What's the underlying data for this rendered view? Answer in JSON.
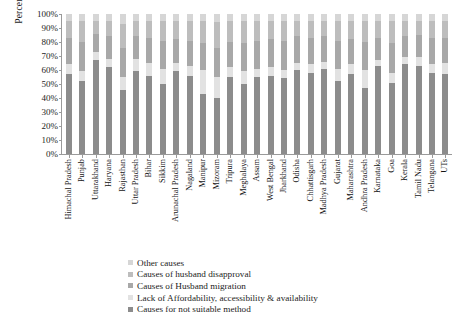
{
  "chart_data": {
    "type": "bar",
    "stacked": true,
    "stack_mode": "percent",
    "title": "",
    "xlabel": "",
    "ylabel": "Percentage",
    "ylim": [
      0,
      100
    ],
    "ytick_labels": [
      "0%",
      "10%",
      "20%",
      "30%",
      "40%",
      "50%",
      "60%",
      "70%",
      "80%",
      "90%",
      "100%"
    ],
    "ytick_values": [
      0,
      10,
      20,
      30,
      40,
      50,
      60,
      70,
      80,
      90,
      100
    ],
    "grid": false,
    "legend_position": "bottom",
    "categories": [
      "Himachal Pradesh",
      "Punjab",
      "Uttarakhand",
      "Haryana",
      "Rajasthan",
      "Uttar Pradesh",
      "Bihar",
      "Sikkim",
      "Arunachal Pradesh",
      "Nagaland",
      "Manipur",
      "Mizoram",
      "Tripura",
      "Meghalaya",
      "Assam",
      "West Bengal",
      "Jharkhand",
      "Odisha",
      "Chhattisgarh",
      "Madhya Pradesh",
      "Gujarat",
      "Maharashtra",
      "Andhra Pradesh",
      "Karnataka",
      "Goa",
      "Kerala",
      "Tamil Nadu",
      "Telangana",
      "UTs"
    ],
    "series": [
      {
        "name": "Causes for not suitable method",
        "color": "#8c8c8c",
        "values": [
          57,
          52,
          67,
          62,
          46,
          59,
          56,
          50,
          59,
          56,
          43,
          40,
          55,
          50,
          55,
          56,
          54,
          60,
          58,
          61,
          52,
          57,
          47,
          63,
          51,
          64,
          63,
          58,
          57
        ]
      },
      {
        "name": "Lack of Affordability, accessibility & availability",
        "color": "#e2e2e2",
        "values": [
          7,
          7,
          6,
          6,
          9,
          9,
          9,
          11,
          6,
          7,
          17,
          15,
          7,
          9,
          6,
          6,
          6,
          5,
          6,
          5,
          9,
          7,
          13,
          4,
          7,
          5,
          6,
          6,
          8
        ]
      },
      {
        "name": "Causes of Husband migration",
        "color": "#a8a8a8",
        "values": [
          19,
          21,
          13,
          16,
          21,
          16,
          18,
          20,
          17,
          18,
          19,
          21,
          18,
          20,
          20,
          20,
          21,
          19,
          19,
          18,
          20,
          18,
          20,
          16,
          21,
          15,
          16,
          19,
          18
        ]
      },
      {
        "name": "Causes of husband disapproval",
        "color": "#bdbdbd",
        "values": [
          12,
          15,
          9,
          11,
          17,
          11,
          12,
          14,
          13,
          14,
          16,
          18,
          15,
          16,
          14,
          13,
          14,
          11,
          12,
          11,
          14,
          13,
          15,
          12,
          16,
          11,
          10,
          12,
          12
        ]
      },
      {
        "name": "Other causes",
        "color": "#d6d6d6",
        "values": [
          5,
          5,
          5,
          5,
          7,
          5,
          5,
          5,
          5,
          5,
          5,
          6,
          5,
          5,
          5,
          5,
          5,
          5,
          5,
          5,
          5,
          5,
          5,
          5,
          5,
          5,
          5,
          5,
          5
        ]
      }
    ]
  },
  "legend": {
    "items": [
      {
        "label": "Other causes",
        "color": "#d6d6d6"
      },
      {
        "label": "Causes of husband disapproval",
        "color": "#bdbdbd"
      },
      {
        "label": "Causes of Husband migration",
        "color": "#a8a8a8"
      },
      {
        "label": "Lack of Affordability, accessibility & availability",
        "color": "#e2e2e2"
      },
      {
        "label": "Causes for not suitable method",
        "color": "#8c8c8c"
      }
    ]
  }
}
